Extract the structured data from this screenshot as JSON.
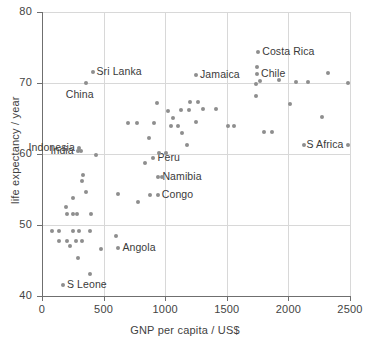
{
  "chart_data": {
    "type": "scatter",
    "title": "",
    "xlabel": "GNP per capita / US$",
    "ylabel": "life expectancy / year",
    "xlim": [
      0,
      2500
    ],
    "ylim": [
      40,
      80
    ],
    "xticks": [
      0,
      500,
      1000,
      1500,
      2000,
      2500
    ],
    "yticks": [
      40,
      50,
      60,
      70,
      80
    ],
    "xtick_labels": [
      "0",
      "500",
      "1000",
      "1500",
      "2000",
      "2500"
    ],
    "ytick_labels": [
      "40",
      "50",
      "60",
      "70",
      "80"
    ],
    "grid": true,
    "grid_color": "#d8d8d8",
    "marker_color": "#8e8e8e",
    "legend": null,
    "points": [
      {
        "x": 170,
        "y": 41.5,
        "label": "S Leone",
        "label_pos": "right"
      },
      {
        "x": 390,
        "y": 43.1,
        "label": ""
      },
      {
        "x": 290,
        "y": 45.3,
        "label": ""
      },
      {
        "x": 480,
        "y": 46.6,
        "label": ""
      },
      {
        "x": 620,
        "y": 46.7,
        "label": "Angola",
        "label_pos": "right"
      },
      {
        "x": 225,
        "y": 47.1,
        "label": ""
      },
      {
        "x": 140,
        "y": 47.8,
        "label": ""
      },
      {
        "x": 200,
        "y": 47.8,
        "label": ""
      },
      {
        "x": 275,
        "y": 47.8,
        "label": ""
      },
      {
        "x": 325,
        "y": 47.8,
        "label": ""
      },
      {
        "x": 600,
        "y": 48.4,
        "label": ""
      },
      {
        "x": 85,
        "y": 49.2,
        "label": ""
      },
      {
        "x": 140,
        "y": 49.2,
        "label": ""
      },
      {
        "x": 250,
        "y": 49.2,
        "label": ""
      },
      {
        "x": 300,
        "y": 49.2,
        "label": ""
      },
      {
        "x": 390,
        "y": 49.2,
        "label": ""
      },
      {
        "x": 205,
        "y": 51.5,
        "label": ""
      },
      {
        "x": 250,
        "y": 51.5,
        "label": ""
      },
      {
        "x": 285,
        "y": 51.5,
        "label": ""
      },
      {
        "x": 400,
        "y": 51.5,
        "label": ""
      },
      {
        "x": 195,
        "y": 52.5,
        "label": ""
      },
      {
        "x": 780,
        "y": 53.3,
        "label": ""
      },
      {
        "x": 255,
        "y": 53.8,
        "label": ""
      },
      {
        "x": 880,
        "y": 54.2,
        "label": ""
      },
      {
        "x": 940,
        "y": 54.2,
        "label": "Congo",
        "label_pos": "right"
      },
      {
        "x": 615,
        "y": 54.3,
        "label": ""
      },
      {
        "x": 355,
        "y": 54.6,
        "label": ""
      },
      {
        "x": 945,
        "y": 56.8,
        "label": "Namibia",
        "label_pos": "right"
      },
      {
        "x": 975,
        "y": 56.8,
        "label": ""
      },
      {
        "x": 325,
        "y": 56.2,
        "label": ""
      },
      {
        "x": 330,
        "y": 57.0,
        "label": ""
      },
      {
        "x": 840,
        "y": 58.8,
        "label": ""
      },
      {
        "x": 905,
        "y": 59.4,
        "label": "Peru",
        "label_pos": "right"
      },
      {
        "x": 950,
        "y": 60.1,
        "label": ""
      },
      {
        "x": 1010,
        "y": 60.1,
        "label": ""
      },
      {
        "x": 440,
        "y": 59.9,
        "label": ""
      },
      {
        "x": 300,
        "y": 60.8,
        "label": "Indonesia",
        "label_pos": "left"
      },
      {
        "x": 290,
        "y": 60.4,
        "label": "India",
        "label_pos": "left"
      },
      {
        "x": 315,
        "y": 60.4,
        "label": ""
      },
      {
        "x": 1180,
        "y": 61.3,
        "label": ""
      },
      {
        "x": 2130,
        "y": 61.2,
        "label": ""
      },
      {
        "x": 2480,
        "y": 61.2,
        "label": "S Africa",
        "label_pos": "left"
      },
      {
        "x": 870,
        "y": 62.2,
        "label": ""
      },
      {
        "x": 1135,
        "y": 62.9,
        "label": ""
      },
      {
        "x": 1800,
        "y": 63.1,
        "label": ""
      },
      {
        "x": 1870,
        "y": 63.1,
        "label": ""
      },
      {
        "x": 1510,
        "y": 63.9,
        "label": ""
      },
      {
        "x": 1560,
        "y": 63.9,
        "label": ""
      },
      {
        "x": 1050,
        "y": 64.0,
        "label": ""
      },
      {
        "x": 1105,
        "y": 64.0,
        "label": ""
      },
      {
        "x": 700,
        "y": 64.3,
        "label": ""
      },
      {
        "x": 770,
        "y": 64.3,
        "label": ""
      },
      {
        "x": 910,
        "y": 64.4,
        "label": ""
      },
      {
        "x": 1250,
        "y": 64.5,
        "label": ""
      },
      {
        "x": 1060,
        "y": 65.1,
        "label": ""
      },
      {
        "x": 2270,
        "y": 65.2,
        "label": ""
      },
      {
        "x": 1020,
        "y": 66.1,
        "label": ""
      },
      {
        "x": 1130,
        "y": 66.2,
        "label": ""
      },
      {
        "x": 1190,
        "y": 66.2,
        "label": ""
      },
      {
        "x": 1310,
        "y": 66.3,
        "label": ""
      },
      {
        "x": 1410,
        "y": 66.3,
        "label": ""
      },
      {
        "x": 930,
        "y": 67.2,
        "label": ""
      },
      {
        "x": 1205,
        "y": 67.3,
        "label": ""
      },
      {
        "x": 1265,
        "y": 67.3,
        "label": ""
      },
      {
        "x": 2010,
        "y": 67.1,
        "label": ""
      },
      {
        "x": 1740,
        "y": 68.2,
        "label": ""
      },
      {
        "x": 2480,
        "y": 70.0,
        "label": ""
      },
      {
        "x": 2060,
        "y": 70.2,
        "label": ""
      },
      {
        "x": 2160,
        "y": 70.2,
        "label": ""
      },
      {
        "x": 1740,
        "y": 69.8,
        "label": ""
      },
      {
        "x": 1770,
        "y": 70.3,
        "label": ""
      },
      {
        "x": 1920,
        "y": 70.4,
        "label": ""
      },
      {
        "x": 2320,
        "y": 71.4,
        "label": ""
      },
      {
        "x": 1745,
        "y": 71.2,
        "label": "Chile",
        "label_pos": "right"
      },
      {
        "x": 1250,
        "y": 71.1,
        "label": "Jamaica",
        "label_pos": "right"
      },
      {
        "x": 355,
        "y": 70.0,
        "label": "China",
        "label_pos": "below"
      },
      {
        "x": 410,
        "y": 71.5,
        "label": "Sri Lanka",
        "label_pos": "right"
      },
      {
        "x": 1745,
        "y": 72.2,
        "label": ""
      },
      {
        "x": 1755,
        "y": 74.4,
        "label": "Costa Rica",
        "label_pos": "right"
      }
    ]
  }
}
